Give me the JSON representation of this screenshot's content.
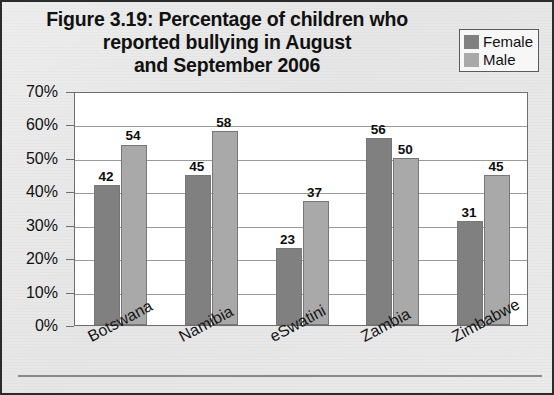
{
  "figure": {
    "title_lines": [
      "Figure 3.19: Percentage of children who",
      "reported bullying in August",
      "and September 2006"
    ],
    "title_full": "Figure 3.19: Percentage of children who reported bullying in August and September 2006"
  },
  "legend": {
    "items": [
      {
        "label": "Female",
        "color": "#808080"
      },
      {
        "label": "Male",
        "color": "#a9a9a9"
      }
    ]
  },
  "axis": {
    "y_ticks": [
      "0%",
      "10%",
      "20%",
      "30%",
      "40%",
      "50%",
      "60%",
      "70%"
    ]
  },
  "chart_data": {
    "type": "bar",
    "title": "Figure 3.19: Percentage of children who reported bullying in August and September 2006",
    "xlabel": "",
    "ylabel": "",
    "ylim": [
      0,
      70
    ],
    "ytick_values": [
      0,
      10,
      20,
      30,
      40,
      50,
      60,
      70
    ],
    "ytick_labels": [
      "0%",
      "10%",
      "20%",
      "30%",
      "40%",
      "50%",
      "60%",
      "70%"
    ],
    "grid": "horizontal",
    "legend_position": "top-right",
    "categories": [
      "Botswana",
      "Namibia",
      "eSwatini",
      "Zambia",
      "Zimbabwe"
    ],
    "series": [
      {
        "name": "Female",
        "color": "#808080",
        "values": [
          42,
          45,
          23,
          56,
          31
        ]
      },
      {
        "name": "Male",
        "color": "#a9a9a9",
        "values": [
          54,
          58,
          37,
          50,
          45
        ]
      }
    ],
    "data_labels": [
      "42",
      "54",
      "45",
      "58",
      "23",
      "37",
      "56",
      "50",
      "31",
      "45"
    ]
  }
}
